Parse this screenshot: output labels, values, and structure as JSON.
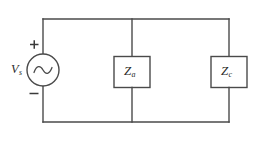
{
  "diagram": {
    "type": "electrical-schematic",
    "background_color": "#ffffff",
    "line_color": "#4a4a4a",
    "label_color": "#2b2b2b",
    "source": {
      "kind": "ac-voltage-source",
      "symbol": "sine-wave-in-circle",
      "label_base": "V",
      "label_subscript": "s",
      "label_full": "Vs",
      "polarity_top": "+",
      "polarity_bottom": "−",
      "center_x": 43,
      "center_y": 70,
      "radius": 16
    },
    "components": [
      {
        "name": "impedance-a",
        "kind": "impedance-box",
        "label_base": "Z",
        "label_subscript": "a",
        "label_full": "Za",
        "branch_x": 132,
        "box_center_y": 72,
        "box_width": 36,
        "box_height": 31
      },
      {
        "name": "impedance-c",
        "kind": "impedance-box",
        "label_base": "Z",
        "label_subscript": "c",
        "label_full": "Zc",
        "branch_x": 229,
        "box_center_y": 72,
        "box_width": 36,
        "box_height": 31
      }
    ],
    "wires": {
      "top_y": 19,
      "bottom_y": 122,
      "left_x": 43,
      "right_x": 229,
      "middle_x": 132
    }
  }
}
